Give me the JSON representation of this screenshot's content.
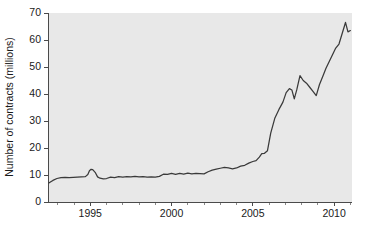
{
  "chart_data": {
    "type": "line",
    "title": "",
    "subtitle": "",
    "xlabel": "",
    "ylabel": "Number of contracts (millions)",
    "xlim": [
      1992.4,
      2011.1
    ],
    "ylim": [
      0,
      70
    ],
    "grid": false,
    "legend": null,
    "legend_position": "none",
    "y_ticks": [
      0,
      10,
      20,
      30,
      40,
      50,
      60,
      70
    ],
    "y_tick_labels": [
      "0",
      "10",
      "20",
      "30",
      "40",
      "50",
      "60",
      "70"
    ],
    "x_ticks_major": [
      1995,
      2000,
      2005,
      2010
    ],
    "x_tick_labels": [
      "1995",
      "2000",
      "2005",
      "2010"
    ],
    "x_ticks_minor": [
      1993,
      1994,
      1996,
      1997,
      1998,
      1999,
      2001,
      2002,
      2003,
      2004,
      2006,
      2007,
      2008,
      2009,
      2011
    ],
    "plot_background_color": "#e8e8e8",
    "figure_background_color": "#ffffff",
    "line_color": "#3a3a3a",
    "axis_color": "#4a4a4a",
    "series": [
      {
        "name": "Number of contracts",
        "x": [
          1992.45,
          1992.7,
          1992.95,
          1993.2,
          1993.45,
          1993.7,
          1993.95,
          1994.2,
          1994.45,
          1994.7,
          1994.85,
          1994.95,
          1995.05,
          1995.15,
          1995.3,
          1995.45,
          1995.6,
          1995.8,
          1996.0,
          1996.25,
          1996.5,
          1996.75,
          1997.0,
          1997.25,
          1997.5,
          1997.75,
          1998.0,
          1998.25,
          1998.5,
          1998.75,
          1999.0,
          1999.25,
          1999.5,
          1999.75,
          2000.0,
          2000.25,
          2000.5,
          2000.75,
          2001.0,
          2001.25,
          2001.5,
          2001.75,
          2002.0,
          2002.25,
          2002.5,
          2002.75,
          2003.0,
          2003.25,
          2003.5,
          2003.75,
          2004.0,
          2004.25,
          2004.5,
          2004.75,
          2005.0,
          2005.2,
          2005.4,
          2005.55,
          2005.7,
          2005.9,
          2006.1,
          2006.35,
          2006.6,
          2006.85,
          2007.05,
          2007.25,
          2007.4,
          2007.55,
          2007.7,
          2007.9,
          2008.1,
          2008.3,
          2008.5,
          2008.7,
          2008.9,
          2009.1,
          2009.3,
          2009.5,
          2009.7,
          2009.9,
          2010.1,
          2010.3,
          2010.5,
          2010.7,
          2010.85,
          2011.0
        ],
        "values": [
          7.0,
          8.0,
          8.7,
          9.0,
          9.1,
          9.0,
          9.1,
          9.2,
          9.3,
          9.4,
          10.2,
          11.6,
          12.1,
          12.0,
          11.0,
          9.3,
          8.8,
          8.6,
          8.7,
          9.2,
          9.0,
          9.4,
          9.2,
          9.4,
          9.3,
          9.5,
          9.3,
          9.4,
          9.2,
          9.3,
          9.2,
          9.5,
          10.3,
          10.2,
          10.6,
          10.2,
          10.6,
          10.3,
          10.7,
          10.4,
          10.6,
          10.5,
          10.4,
          11.2,
          11.8,
          12.2,
          12.5,
          12.8,
          12.6,
          12.3,
          12.6,
          13.3,
          13.6,
          14.4,
          15.0,
          15.3,
          16.6,
          17.9,
          18.0,
          19.0,
          25.5,
          31.0,
          34.2,
          37.0,
          40.5,
          42.0,
          41.5,
          38.2,
          41.5,
          46.8,
          45.0,
          44.0,
          42.5,
          41.0,
          39.4,
          43.5,
          46.5,
          49.5,
          52.0,
          54.5,
          57.0,
          58.5,
          62.5,
          66.5,
          63.0,
          63.5
        ]
      }
    ]
  }
}
